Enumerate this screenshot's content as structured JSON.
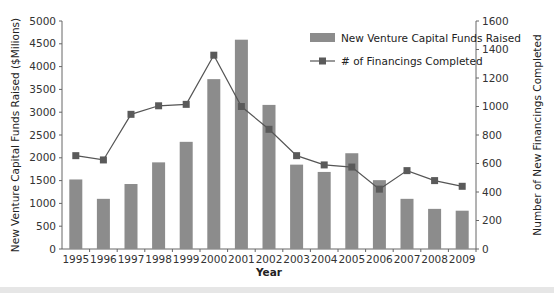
{
  "chart_data": {
    "type": "bar",
    "title": "",
    "xlabel": "Year",
    "ylabel": "New Venture Capital Funds Raised ($Milions)",
    "y2label": "Number of New Financings Completed",
    "categories": [
      "1995",
      "1996",
      "1997",
      "1998",
      "1999",
      "2000",
      "2001",
      "2002",
      "2003",
      "2004",
      "2005",
      "2006",
      "2007",
      "2008",
      "2009"
    ],
    "series": [
      {
        "name": "New Venture Capital Funds Raised",
        "type": "bar",
        "axis": "left",
        "color": "#8c8c8c",
        "values": [
          1525,
          1100,
          1425,
          1900,
          2350,
          3725,
          4590,
          3160,
          1850,
          1690,
          2100,
          1510,
          1100,
          880,
          840
        ]
      },
      {
        "name": "# of Financings Completed",
        "type": "line",
        "axis": "right",
        "color": "#555555",
        "values": [
          655,
          625,
          945,
          1005,
          1015,
          1360,
          1000,
          840,
          655,
          590,
          575,
          420,
          550,
          480,
          440
        ]
      }
    ],
    "ylim": [
      0,
      5000
    ],
    "y2lim": [
      0,
      1600
    ],
    "yticks": [
      "0",
      "500",
      "1000",
      "1500",
      "2000",
      "2500",
      "3000",
      "3500",
      "4000",
      "4500",
      "5000"
    ],
    "y2ticks": [
      "0",
      "200",
      "400",
      "600",
      "800",
      "1000",
      "1200",
      "1400",
      "1600"
    ],
    "grid": false,
    "legend_position": "top-right inside"
  },
  "legend": {
    "bar_label": "New Venture Capital Funds Raised",
    "line_label": "# of Financings Completed"
  }
}
